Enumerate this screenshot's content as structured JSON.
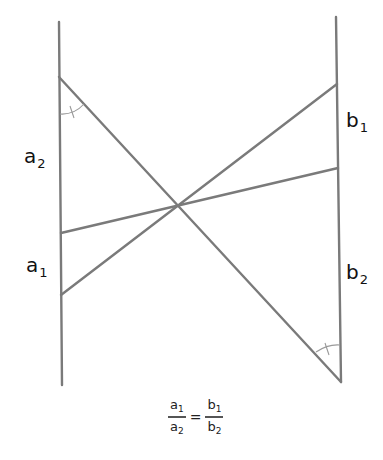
{
  "diagram": {
    "type": "geometry-proportion",
    "line_color": "#7a7a7a",
    "arc_color": "#9a9a9a",
    "lines": {
      "left_vertical": {
        "x1": 59,
        "y1": 22,
        "x2": 62,
        "y2": 385
      },
      "right_vertical": {
        "x1": 336,
        "y1": 17,
        "x2": 341,
        "y2": 382
      },
      "transversal_main": {
        "x1": 59,
        "y1": 77,
        "x2": 341,
        "y2": 382
      },
      "transversal_upper": {
        "x1": 61,
        "y1": 295,
        "x2": 337,
        "y2": 84
      },
      "transversal_lower": {
        "x1": 61,
        "y1": 233,
        "x2": 338,
        "y2": 168
      }
    },
    "intersection": {
      "x": 179,
      "y": 205
    },
    "labels": {
      "a2": {
        "base": "a",
        "sub": "2"
      },
      "a1": {
        "base": "a",
        "sub": "1"
      },
      "b1": {
        "base": "b",
        "sub": "1"
      },
      "b2": {
        "base": "b",
        "sub": "2"
      }
    },
    "angle_marks": [
      "equal-angle-top-left",
      "equal-angle-bottom-right"
    ],
    "formula": {
      "left_num": {
        "base": "a",
        "sub": "1"
      },
      "left_den": {
        "base": "a",
        "sub": "2"
      },
      "equals": "=",
      "right_num": {
        "base": "b",
        "sub": "1"
      },
      "right_den": {
        "base": "b",
        "sub": "2"
      }
    }
  }
}
